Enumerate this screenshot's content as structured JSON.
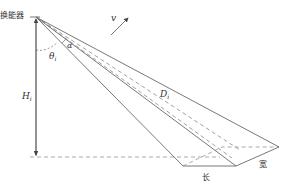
{
  "diagram": {
    "labels": {
      "transducer": "换能器",
      "velocity": "v",
      "theta": "θ",
      "theta_sub": "i",
      "alpha": "α",
      "height": "H",
      "height_sub": "i",
      "distance": "D",
      "distance_sub": "i",
      "length": "长",
      "width": "宽"
    },
    "colors": {
      "line": "#555555",
      "dash": "#777777",
      "text": "#333333"
    }
  }
}
